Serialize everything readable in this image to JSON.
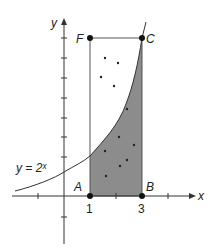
{
  "figure": {
    "function_label": "y = 2ˣ",
    "axes": {
      "x_label": "x",
      "y_label": "y"
    },
    "tick_labels": {
      "x_1": "1",
      "x_3": "3"
    },
    "points": {
      "A": {
        "label": "A",
        "x": 1,
        "y": 0
      },
      "B": {
        "label": "B",
        "x": 3,
        "y": 0
      },
      "C": {
        "label": "C",
        "x": 3,
        "y": 8
      },
      "F": {
        "label": "F",
        "x": 1,
        "y": 8
      }
    },
    "shaded_region": "area under y = 2^x from x = 1 to x = 3",
    "random_dots_inside_rectangle": 11,
    "colors": {
      "shade": "#8c8c8c",
      "line": "#333333",
      "background": "#ffffff"
    }
  }
}
